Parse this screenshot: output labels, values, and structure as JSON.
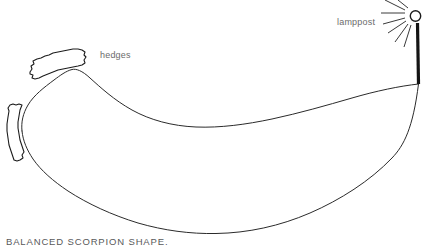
{
  "drawing": {
    "title": "Balanced Scorpion Shape sketch",
    "background_color": "#ffffff",
    "ink_color": "#2b2b2b"
  },
  "caption": {
    "text": "BALANCED SCORPION SHAPE.",
    "color": "#58585a"
  },
  "labels": {
    "hedges": {
      "text": "hedges",
      "color": "#6b6b6b"
    },
    "lamppost": {
      "text": "lamppost",
      "color": "#6b6b6b"
    }
  },
  "elements": {
    "upper_curve_name": "upper-sweep-curve",
    "lower_curve_name": "lower-sweep-curve",
    "hedge_upper_name": "hedge-upper",
    "hedge_lower_name": "hedge-lower",
    "lamp_bulb_name": "lamp-bulb",
    "lamp_post_name": "lamp-post",
    "ray_count": 7
  }
}
